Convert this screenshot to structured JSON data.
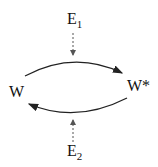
{
  "diagram": {
    "nodes": {
      "w": {
        "label": "W"
      },
      "w_star": {
        "label": "W*"
      },
      "e1": {
        "label": "E",
        "sub": "1"
      },
      "e2": {
        "label": "E",
        "sub": "2"
      }
    },
    "edges": [
      {
        "from": "W",
        "to": "W*",
        "style": "solid",
        "curve": "upper"
      },
      {
        "from": "W*",
        "to": "W",
        "style": "solid",
        "curve": "lower"
      },
      {
        "from": "E1",
        "to": "upper-arc",
        "style": "dashed"
      },
      {
        "from": "E2",
        "to": "lower-arc",
        "style": "dashed"
      }
    ],
    "colors": {
      "line": "#222222",
      "background": "#ffffff"
    }
  }
}
